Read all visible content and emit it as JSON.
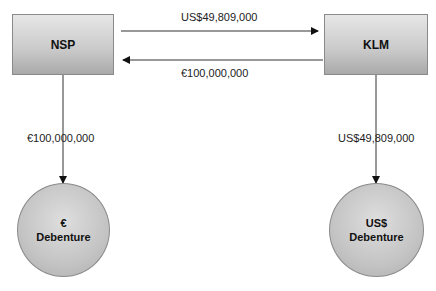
{
  "nodes": {
    "nsp": {
      "label": "NSP"
    },
    "klm": {
      "label": "KLM"
    },
    "euro_debenture": {
      "line1": "€",
      "line2": "Debenture"
    },
    "usd_debenture": {
      "line1": "US$",
      "line2": "Debenture"
    }
  },
  "flows": {
    "nsp_to_klm": "US$49,809,000",
    "klm_to_nsp": "€100,000,000",
    "nsp_to_euro_debenture": "€100,000,000",
    "klm_to_usd_debenture": "US$49,809,000"
  },
  "colors": {
    "line": "#333333",
    "node_border": "#8a8a8a"
  }
}
